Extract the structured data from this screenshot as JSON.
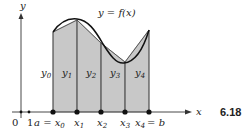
{
  "figure": {
    "number": "6.18",
    "curve_label": "y = f(x)",
    "axes": {
      "x_label": "x",
      "y_label": "y",
      "origin_label": "0",
      "unit_label": "1"
    },
    "partition": {
      "left_label": "a = x",
      "right_label": "= b",
      "points": [
        {
          "name": "x",
          "sub": "0",
          "ordinate": "y",
          "ordinate_sub": "0"
        },
        {
          "name": "x",
          "sub": "1",
          "ordinate": "y",
          "ordinate_sub": "1"
        },
        {
          "name": "x",
          "sub": "2",
          "ordinate": "y",
          "ordinate_sub": "2"
        },
        {
          "name": "x",
          "sub": "3",
          "ordinate": "y",
          "ordinate_sub": "3"
        },
        {
          "name": "x",
          "sub": "4",
          "ordinate": "y",
          "ordinate_sub": "4"
        }
      ]
    },
    "colors": {
      "fill": "#c8c8c8",
      "curve": "#111111",
      "axis": "#333333"
    }
  }
}
